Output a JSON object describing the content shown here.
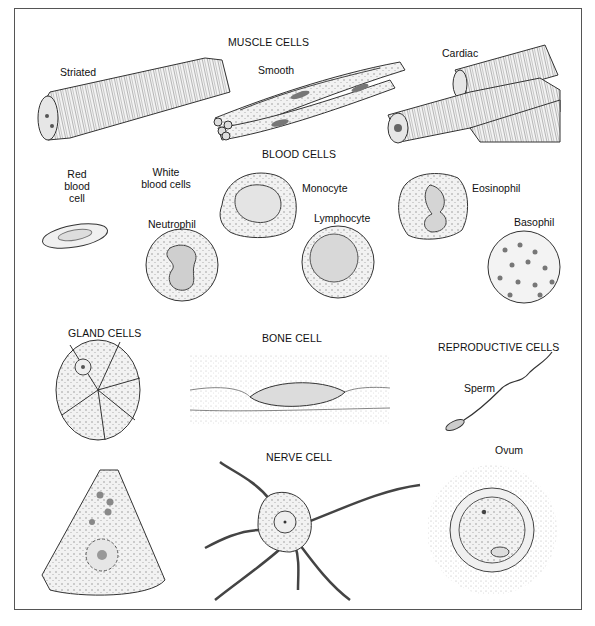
{
  "sections": {
    "muscle": {
      "title": "MUSCLE CELLS",
      "labels": [
        "Striated",
        "Smooth",
        "Cardiac"
      ]
    },
    "blood": {
      "title": "BLOOD CELLS",
      "red_label": "Red\nblood\ncell",
      "red_lines": [
        "Red",
        "blood",
        "cell"
      ],
      "white_lines": [
        "White",
        "blood cells"
      ],
      "labels": [
        "Neutrophil",
        "Monocyte",
        "Lymphocyte",
        "Eosinophil",
        "Basophil"
      ]
    },
    "gland": {
      "title": "GLAND CELLS"
    },
    "bone": {
      "title": "BONE CELL"
    },
    "nerve": {
      "title": "NERVE CELL"
    },
    "reproductive": {
      "title": "REPRODUCTIVE CELLS",
      "labels": [
        "Sperm",
        "Ovum"
      ]
    }
  },
  "colors": {
    "ink": "#222222",
    "frame": "#555555",
    "fill": "#eeeeee",
    "background": "#ffffff"
  }
}
